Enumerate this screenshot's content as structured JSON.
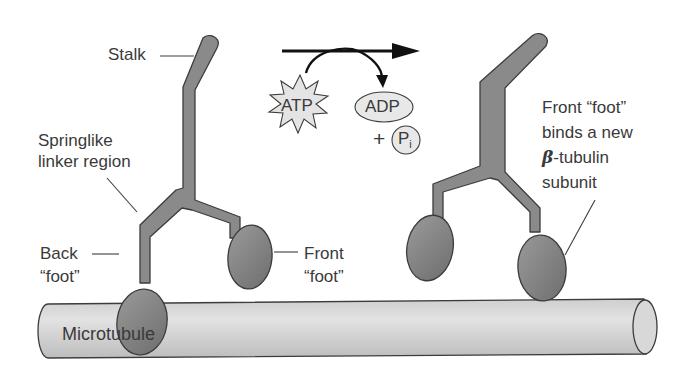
{
  "diagram": {
    "colors": {
      "protein_fill": "#8a8a8a",
      "protein_stroke": "#3c3c3c",
      "microtubule_fill": "#d6d6d6",
      "atp_fill": "#e4e4e4",
      "arrow": "#111111",
      "text": "#3a3a3a"
    },
    "labels": {
      "stalk": "Stalk",
      "linker_line1": "Springlike",
      "linker_line2": "linker region",
      "back_foot_line1": "Back",
      "back_foot_line2": "“foot”",
      "front_foot_line1": "Front",
      "front_foot_line2": "“foot”",
      "new_front_line1": "Front “foot”",
      "new_front_line2": "binds a new",
      "new_front_line3_symbol": "β",
      "new_front_line3_rest": "-tubulin",
      "new_front_line4": "subunit",
      "microtubule": "Microtubule"
    },
    "reaction": {
      "reactant": "ATP",
      "product1": "ADP",
      "plus": "+",
      "product2_main": "P",
      "product2_sub": "i"
    }
  }
}
